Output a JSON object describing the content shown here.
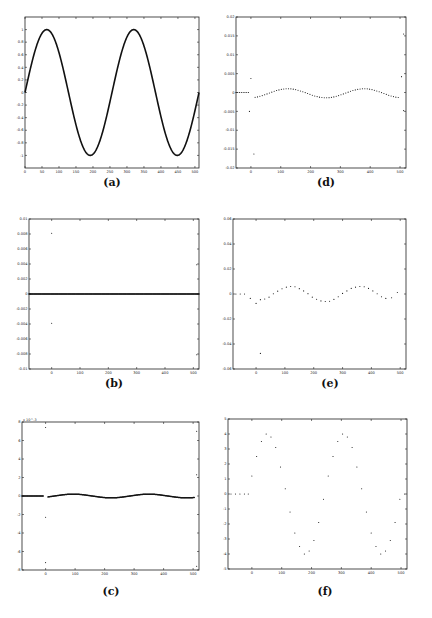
{
  "chart_data": [
    {
      "id": "a",
      "caption": "(a)",
      "type": "line",
      "title": "",
      "xlabel": "",
      "ylabel": "",
      "xlim": [
        0,
        512
      ],
      "ylim": [
        -1.2,
        1.2
      ],
      "xticks": [
        0,
        50,
        100,
        150,
        200,
        250,
        300,
        350,
        400,
        450,
        500
      ],
      "yticks": [
        -1,
        -0.8,
        -0.6,
        -0.4,
        -0.2,
        0,
        0.2,
        0.4,
        0.6,
        0.8,
        1
      ],
      "ytick_labels": [
        "-1",
        "-0.8",
        "-0.6",
        "-0.4",
        "-0.2",
        "0",
        "0.2",
        "0.4",
        "0.6",
        "0.8",
        "1"
      ],
      "series": [
        {
          "name": "signal",
          "style": "line",
          "function": "sin(2*pi*x/256)",
          "x_range": [
            0,
            512
          ],
          "samples": 512
        }
      ],
      "grid": false
    },
    {
      "id": "b",
      "caption": "(b)",
      "type": "scatter",
      "xlim": [
        -80,
        520
      ],
      "ylim": [
        -0.01,
        0.01
      ],
      "xticks": [
        0,
        100,
        200,
        300,
        400,
        500
      ],
      "yticks": [
        -0.01,
        -0.008,
        -0.006,
        -0.004,
        -0.002,
        0,
        0.002,
        0.004,
        0.006,
        0.008,
        0.01
      ],
      "ytick_labels": [
        "-0.01",
        "-0.008",
        "-0.006",
        "-0.004",
        "-0.002",
        "0",
        "0.002",
        "0.004",
        "0.006",
        "0.008",
        "0.01"
      ],
      "series": [
        {
          "name": "coefficients",
          "style": "dense-dots",
          "x_range": [
            -80,
            520
          ],
          "value": 0
        },
        {
          "name": "outliers",
          "style": "dots",
          "points": [
            [
              0,
              0.0081
            ],
            [
              0,
              -0.0039
            ],
            [
              512,
              0.0039
            ],
            [
              512,
              -0.0081
            ]
          ]
        }
      ],
      "grid": false
    },
    {
      "id": "c",
      "caption": "(c)",
      "type": "scatter",
      "xlim": [
        -80,
        520
      ],
      "ylim": [
        -8,
        8
      ],
      "y_multiplier": "x 10^-3",
      "xticks": [
        0,
        100,
        200,
        300,
        400,
        500
      ],
      "yticks": [
        -8,
        -6,
        -4,
        -2,
        0,
        2,
        4,
        6,
        8
      ],
      "ytick_labels": [
        "-8",
        "-6",
        "-4",
        "-2",
        "0",
        "2",
        "4",
        "6",
        "8"
      ],
      "series": [
        {
          "name": "flat",
          "style": "dense-dots",
          "x_range": [
            -80,
            -8
          ],
          "value": 0
        },
        {
          "name": "wave",
          "style": "dense-dots",
          "function": "0.2*sin(2*pi*(x-30)/256)",
          "x_range": [
            8,
            505
          ]
        },
        {
          "name": "outliers",
          "style": "dots",
          "points": [
            [
              0,
              7.4
            ],
            [
              0,
              -2.3
            ],
            [
              0,
              -7.2
            ],
            [
              512,
              7.0
            ],
            [
              512,
              2.3
            ],
            [
              512,
              -7.6
            ]
          ]
        }
      ],
      "grid": false
    },
    {
      "id": "d",
      "caption": "(d)",
      "type": "scatter",
      "xlim": [
        -50,
        520
      ],
      "ylim": [
        -0.02,
        0.02
      ],
      "xticks": [
        0,
        100,
        200,
        300,
        400,
        500
      ],
      "yticks": [
        -0.02,
        -0.015,
        -0.01,
        -0.005,
        0,
        0.005,
        0.01,
        0.015,
        0.02
      ],
      "ytick_labels": [
        "-0.02",
        "-0.015",
        "-0.01",
        "-0.005",
        "0",
        "0.005",
        "0.01",
        "0.015",
        "0.02"
      ],
      "series": [
        {
          "name": "flat",
          "style": "dots",
          "x_range": [
            -50,
            -8
          ],
          "step": 6,
          "value": 0
        },
        {
          "name": "wave",
          "style": "dots",
          "function": "0.0012*sin(2*pi*(x-60)/256) - 0.0002",
          "x_range": [
            14,
            500
          ],
          "step": 8
        },
        {
          "name": "outliers",
          "style": "dots",
          "points": [
            [
              0,
              0.0037
            ],
            [
              -5,
              -0.005
            ],
            [
              10,
              -0.0163
            ],
            [
              512,
              0.0155
            ],
            [
              505,
              0.0042
            ],
            [
              512,
              -0.0048
            ]
          ]
        }
      ],
      "grid": false
    },
    {
      "id": "e",
      "caption": "(e)",
      "type": "scatter",
      "xlim": [
        -80,
        520
      ],
      "ylim": [
        -0.06,
        0.06
      ],
      "xticks": [
        0,
        100,
        200,
        300,
        400,
        500
      ],
      "yticks": [
        -0.06,
        -0.04,
        -0.02,
        0,
        0.02,
        0.04,
        0.06
      ],
      "ytick_labels": [
        "-0.06",
        "-0.04",
        "-0.02",
        "0",
        "0.02",
        "0.04",
        "0.06"
      ],
      "series": [
        {
          "name": "flat",
          "style": "dots",
          "points": [
            [
              -70,
              0
            ],
            [
              -55,
              0
            ],
            [
              -40,
              0
            ]
          ]
        },
        {
          "name": "wave",
          "style": "dots",
          "points": [
            [
              -20,
              -0.0035
            ],
            [
              0,
              -0.0075
            ],
            [
              15,
              -0.0045
            ],
            [
              30,
              -0.004
            ],
            [
              45,
              -0.0025
            ],
            [
              60,
              0.0002
            ],
            [
              75,
              0.0023
            ],
            [
              90,
              0.0042
            ],
            [
              105,
              0.0055
            ],
            [
              120,
              0.006
            ],
            [
              135,
              0.0058
            ],
            [
              150,
              0.0043
            ],
            [
              165,
              0.0025
            ],
            [
              180,
              0.0003
            ],
            [
              195,
              -0.0025
            ],
            [
              210,
              -0.0042
            ],
            [
              225,
              -0.0055
            ],
            [
              240,
              -0.006
            ],
            [
              255,
              -0.0058
            ],
            [
              270,
              -0.0043
            ],
            [
              285,
              -0.0022
            ],
            [
              300,
              0.0005
            ],
            [
              315,
              0.0025
            ],
            [
              330,
              0.0045
            ],
            [
              345,
              0.0055
            ],
            [
              360,
              0.006
            ],
            [
              375,
              0.0058
            ],
            [
              390,
              0.0045
            ],
            [
              405,
              0.0025
            ],
            [
              420,
              0.0002
            ],
            [
              435,
              -0.0022
            ],
            [
              450,
              -0.0035
            ],
            [
              470,
              -0.003
            ],
            [
              490,
              0.0012
            ]
          ]
        },
        {
          "name": "outlier",
          "style": "dots",
          "points": [
            [
              15,
              -0.0475
            ]
          ]
        }
      ],
      "grid": false
    },
    {
      "id": "f",
      "caption": "(f)",
      "type": "scatter",
      "xlim": [
        -80,
        520
      ],
      "ylim": [
        -5,
        5
      ],
      "xticks": [
        0,
        100,
        200,
        300,
        400,
        500
      ],
      "yticks": [
        -5,
        -4,
        -3,
        -2,
        -1,
        0,
        1,
        2,
        3,
        4,
        5
      ],
      "ytick_labels": [
        "-5",
        "-4",
        "-3",
        "-2",
        "-1",
        "0",
        "1",
        "2",
        "3",
        "4",
        "5"
      ],
      "series": [
        {
          "name": "flat",
          "style": "dots",
          "points": [
            [
              -70,
              0
            ],
            [
              -55,
              0
            ],
            [
              -40,
              0
            ],
            [
              -25,
              0
            ],
            [
              -12,
              0
            ]
          ]
        },
        {
          "name": "wave",
          "style": "dots",
          "points": [
            [
              0,
              1.2
            ],
            [
              16,
              2.5
            ],
            [
              32,
              3.5
            ],
            [
              48,
              4.0
            ],
            [
              64,
              3.8
            ],
            [
              80,
              3.1
            ],
            [
              96,
              1.8
            ],
            [
              112,
              0.35
            ],
            [
              128,
              -1.2
            ],
            [
              144,
              -2.6
            ],
            [
              160,
              -3.5
            ],
            [
              176,
              -4.0
            ],
            [
              192,
              -3.8
            ],
            [
              208,
              -3.1
            ],
            [
              224,
              -1.9
            ],
            [
              240,
              -0.35
            ],
            [
              256,
              1.2
            ],
            [
              272,
              2.5
            ],
            [
              288,
              3.5
            ],
            [
              304,
              4.0
            ],
            [
              320,
              3.8
            ],
            [
              336,
              3.1
            ],
            [
              352,
              1.8
            ],
            [
              368,
              0.35
            ],
            [
              384,
              -1.2
            ],
            [
              400,
              -2.6
            ],
            [
              416,
              -3.5
            ],
            [
              432,
              -4.0
            ],
            [
              448,
              -3.8
            ],
            [
              464,
              -3.1
            ],
            [
              480,
              -1.9
            ],
            [
              496,
              -0.35
            ],
            [
              512,
              0.0
            ]
          ]
        }
      ],
      "grid": false
    }
  ]
}
